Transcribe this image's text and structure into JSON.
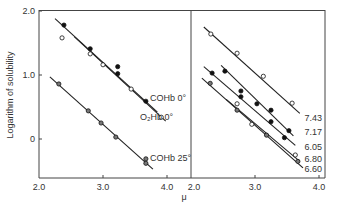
{
  "chart_data": [
    {
      "type": "scatter",
      "panel": "left",
      "title": "",
      "xlabel": "μ",
      "ylabel": "Logarithm of solubility",
      "xlim": [
        2.0,
        4.0
      ],
      "ylim": [
        -0.6,
        2.0
      ],
      "xticks": [
        "2.0",
        "3.0",
        "4.0"
      ],
      "yticks": [
        "2.0",
        "1.0",
        "0"
      ],
      "grid": false,
      "series": [
        {
          "name": "COHb 0°",
          "marker": "filled",
          "points": [
            [
              2.39,
              1.78
            ],
            [
              2.8,
              1.41
            ],
            [
              3.23,
              1.13
            ],
            [
              3.23,
              1.02
            ],
            [
              3.67,
              0.59
            ]
          ],
          "fit": [
            [
              2.25,
              1.88
            ],
            [
              3.85,
              0.42
            ]
          ]
        },
        {
          "name": "O₂Hb 0°",
          "marker": "open",
          "points": [
            [
              2.36,
              1.58
            ],
            [
              2.8,
              1.33
            ],
            [
              3.0,
              1.16
            ],
            [
              3.44,
              0.78
            ],
            [
              3.91,
              0.34
            ]
          ],
          "fit": [
            [
              2.55,
              1.6
            ],
            [
              3.98,
              0.28
            ]
          ]
        },
        {
          "name": "COHb 25°",
          "marker": "half",
          "points": [
            [
              2.31,
              0.86
            ],
            [
              2.77,
              0.44
            ],
            [
              2.97,
              0.25
            ],
            [
              3.2,
              0.03
            ],
            [
              3.67,
              -0.31
            ],
            [
              3.67,
              -0.38
            ]
          ],
          "fit": [
            [
              2.17,
              0.97
            ],
            [
              3.78,
              -0.47
            ]
          ]
        }
      ]
    },
    {
      "type": "scatter",
      "panel": "right",
      "title": "",
      "xlabel": "μ",
      "ylabel": "",
      "xlim": [
        2.0,
        4.0
      ],
      "ylim": [
        -0.6,
        2.0
      ],
      "xticks": [
        "2.0",
        "3.0",
        "4.0"
      ],
      "grid": false,
      "series": [
        {
          "name": "7.43",
          "marker": "open",
          "points": [
            [
              2.31,
              1.64
            ],
            [
              2.72,
              1.34
            ],
            [
              3.13,
              0.98
            ],
            [
              3.58,
              0.56
            ]
          ],
          "fit": [
            [
              2.2,
              1.75
            ],
            [
              3.7,
              0.4
            ]
          ]
        },
        {
          "name": "7.17",
          "marker": "filled",
          "points": [
            [
              2.53,
              1.06
            ],
            [
              2.78,
              0.75
            ],
            [
              3.03,
              0.55
            ],
            [
              3.25,
              0.45
            ],
            [
              3.53,
              0.13
            ]
          ],
          "fit": [
            [
              2.47,
              1.15
            ],
            [
              3.6,
              0.05
            ]
          ]
        },
        {
          "name": "6.05",
          "marker": "filled",
          "points": [
            [
              2.33,
              1.03
            ],
            [
              2.78,
              0.66
            ],
            [
              3.25,
              0.27
            ],
            [
              3.46,
              0.02
            ]
          ],
          "fit": [
            [
              2.2,
              1.13
            ],
            [
              3.63,
              -0.1
            ]
          ]
        },
        {
          "name": "6.80",
          "marker": "open",
          "points": [
            [
              2.72,
              0.55
            ],
            [
              2.95,
              0.23
            ],
            [
              3.63,
              -0.25
            ]
          ],
          "fit": [
            [
              2.55,
              0.62
            ],
            [
              3.7,
              -0.35
            ]
          ]
        },
        {
          "name": "6.60",
          "marker": "half",
          "points": [
            [
              2.3,
              0.87
            ],
            [
              2.72,
              0.45
            ],
            [
              3.18,
              0.06
            ],
            [
              3.67,
              -0.35
            ]
          ],
          "fit": [
            [
              2.17,
              0.95
            ],
            [
              3.75,
              -0.45
            ]
          ]
        }
      ]
    }
  ],
  "labels": {
    "ylabel": "Logarithm of solubility",
    "xlabel": "μ",
    "left_y_ticks": [
      "2.0",
      "1.0",
      "0"
    ],
    "left_x_ticks": [
      "2.0",
      "3.0",
      "4.0"
    ],
    "right_x_ticks": [
      "2.0",
      "3.0",
      "4.0"
    ],
    "left_series": [
      "COHb 0°",
      "O₂Hb 0°",
      "COHb 25°"
    ],
    "right_series": [
      "7.43",
      "7.17",
      "6.05",
      "6.80",
      "6.60"
    ]
  }
}
